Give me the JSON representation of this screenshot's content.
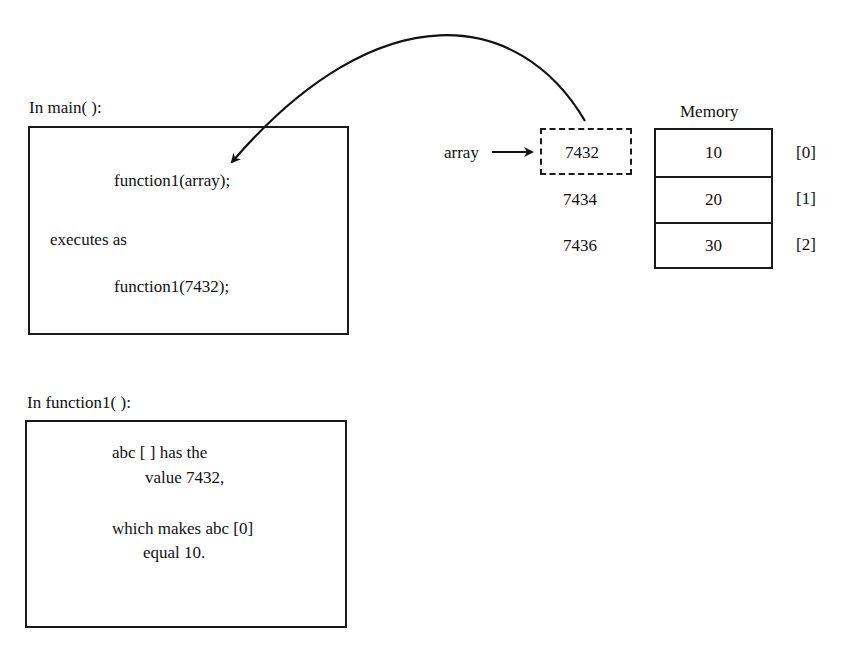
{
  "main_section": {
    "heading": "In main( ):",
    "line1": "function1(array);",
    "line2": "executes as",
    "line3": "function1(7432);"
  },
  "function_section": {
    "heading": "In function1( ):",
    "line1": "abc [ ] has the",
    "line2": "value 7432,",
    "line3": "which makes abc [0]",
    "line4": "equal 10."
  },
  "pointer": {
    "name": "array",
    "address": "7432"
  },
  "addresses": [
    "7432",
    "7434",
    "7436"
  ],
  "memory": {
    "title": "Memory",
    "cells": [
      {
        "value": "10",
        "index": "[0]"
      },
      {
        "value": "20",
        "index": "[1]"
      },
      {
        "value": "30",
        "index": "[2]"
      }
    ]
  }
}
